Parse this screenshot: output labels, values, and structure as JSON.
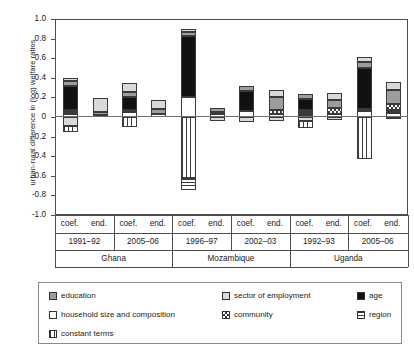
{
  "chart_data": {
    "type": "bar",
    "subtype": "stacked-bar-diverging",
    "title": "",
    "xlabel": "",
    "ylabel": "urban-rural difference in (log) welfare ratios",
    "ylim": [
      -1.0,
      1.0
    ],
    "ytick_labels": [
      "1.0",
      "0.8",
      "0.6",
      "0.4",
      "0.2",
      "0",
      "-0.2",
      "-0.4",
      "-0.6",
      "-0.8",
      "-1.0"
    ],
    "ytick_values": [
      1.0,
      0.8,
      0.6,
      0.4,
      0.2,
      0,
      -0.2,
      -0.4,
      -0.6,
      -0.8,
      -1.0
    ],
    "grid": false,
    "legend_position": "below-plot",
    "zero_reference_line": true,
    "categories": [
      "coef.",
      "end.",
      "coef.",
      "end.",
      "coef.",
      "end.",
      "coef.",
      "end.",
      "coef.",
      "end.",
      "coef.",
      "end."
    ],
    "survey_years": [
      "1991–92",
      "2005–06",
      "1996–97",
      "2002–03",
      "1992–93",
      "2005–06"
    ],
    "countries": [
      "Ghana",
      "Mozambique",
      "Uganda"
    ],
    "series": [
      {
        "name": "education",
        "key": "education",
        "pattern": "solid-mid-gray",
        "color": "#9d9d9d",
        "values": [
          0.05,
          0.026,
          0.055,
          0.055,
          0.04,
          0.038,
          0.048,
          0.132,
          0.044,
          0.08,
          0.066,
          0.14
        ]
      },
      {
        "name": "sector of employment",
        "key": "sector",
        "pattern": "solid-light-gray",
        "color": "#d9d9d9",
        "values": [
          0.028,
          0.148,
          0.082,
          0.092,
          0.03,
          0.0,
          0.0,
          0.075,
          0.0,
          0.078,
          0.05,
          0.078
        ]
      },
      {
        "name": "age",
        "key": "age",
        "pattern": "solid-black",
        "color": "#111111",
        "values": [
          0.245,
          0.0,
          0.13,
          0.0,
          0.63,
          0.0,
          0.21,
          0.0,
          0.12,
          0.0,
          0.42,
          0.0
        ]
      },
      {
        "name": "household size and composition",
        "key": "household",
        "pattern": "white-open",
        "color": "#ffffff",
        "values": [
          0.03,
          0.02,
          0.055,
          0.03,
          0.2,
          0.03,
          0.06,
          0.03,
          0.018,
          0.03,
          0.06,
          0.045
        ]
      },
      {
        "name": "community",
        "key": "community",
        "pattern": "cross-hatch",
        "color": "#ffffff",
        "values": [
          0.016,
          0.0,
          0.0,
          0.0,
          0.0,
          0.0,
          0.0,
          0.04,
          0.02,
          0.062,
          0.0,
          0.062
        ]
      },
      {
        "name": "region",
        "key": "region",
        "pattern": "horizontal-stripes",
        "color": "#ffffff",
        "values": [
          0.03,
          0.0,
          0.02,
          0.0,
          -0.13,
          0.022,
          0.0,
          0.0,
          0.03,
          0.0,
          0.02,
          0.03
        ]
      },
      {
        "name": "constant terms",
        "key": "constant",
        "pattern": "vertical-stripes",
        "color": "#ffffff",
        "values": [
          -0.068,
          0.0,
          -0.1,
          0.0,
          -0.62,
          0.0,
          0.0,
          0.0,
          -0.075,
          0.0,
          -0.43,
          0.0
        ]
      },
      {
        "name": "negative education",
        "key": "education_neg",
        "pattern": "solid-mid-gray",
        "color": "#d9d9d9",
        "values": [
          -0.09,
          0.0,
          0.0,
          0.0,
          0.0,
          -0.04,
          -0.048,
          -0.04,
          -0.04,
          -0.03,
          0.0,
          -0.018
        ]
      }
    ],
    "bar_totals": [
      0.53,
      0.195,
      0.365,
      0.175,
      0.89,
      0.05,
      0.32,
      0.275,
      0.215,
      0.25,
      0.62,
      0.355
    ],
    "bar_minimums": [
      -0.16,
      0.0,
      -0.1,
      0.0,
      -0.75,
      -0.04,
      -0.048,
      -0.04,
      -0.115,
      -0.03,
      -0.43,
      -0.018
    ]
  },
  "legend": {
    "items": [
      {
        "label": "education",
        "swatch": "education-swatch"
      },
      {
        "label": "sector of employment",
        "swatch": "sector-swatch"
      },
      {
        "label": "age",
        "swatch": "age-swatch"
      },
      {
        "label": "household size and composition",
        "swatch": "household-swatch"
      },
      {
        "label": "community",
        "swatch": "community-swatch"
      },
      {
        "label": "region",
        "swatch": "region-swatch"
      },
      {
        "label": "constant terms",
        "swatch": "constant-swatch"
      }
    ]
  },
  "axis": {
    "y_title": "urban-rural difference in (log) welfare ratios",
    "ticks": [
      "1.0",
      "0.8",
      "0.6",
      "0.4",
      "0.2",
      "0",
      "-0.2",
      "-0.4",
      "-0.6",
      "-0.8",
      "-1.0"
    ]
  },
  "xaxis": {
    "decomposition_labels": [
      "coef.",
      "end.",
      "coef.",
      "end.",
      "coef.",
      "end.",
      "coef.",
      "end.",
      "coef.",
      "end.",
      "coef.",
      "end."
    ],
    "periods": [
      "1991–92",
      "2005–06",
      "1996–97",
      "2002–03",
      "1992–93",
      "2005–06"
    ],
    "countries": [
      "Ghana",
      "Mozambique",
      "Uganda"
    ]
  }
}
